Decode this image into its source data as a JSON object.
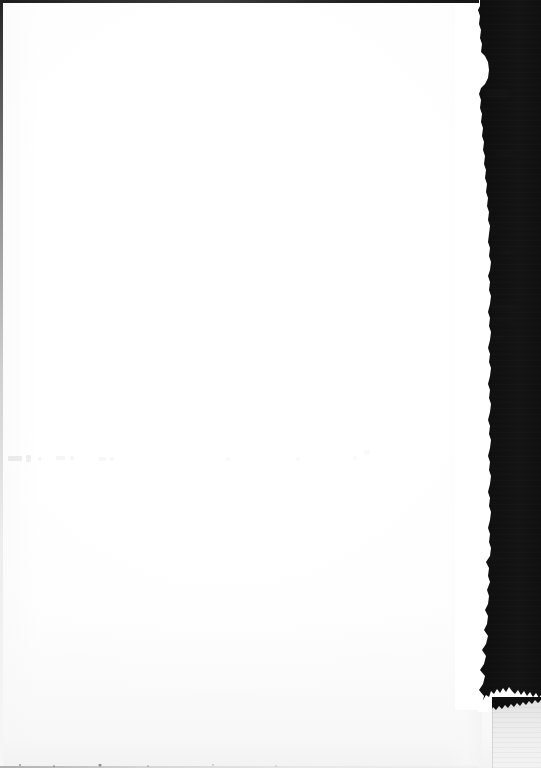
{
  "document": {
    "kind": "scanned-page",
    "title": "Scanned book page (blank verso)",
    "page_content_text": "",
    "visible_text": [],
    "notes_on_content": "No legible printed text is rendered in the pixels; the page body is blank."
  },
  "canvas": {
    "width_px": 541,
    "height_px": 768
  },
  "regions": [
    {
      "name": "paper-sheet",
      "label": "Blank white page",
      "color": "#ffffff",
      "bounds": {
        "x": 0,
        "y": 0,
        "w": 482,
        "h": 768
      }
    },
    {
      "name": "dark-band",
      "label": "Dark scanner background strip",
      "color": "#111111",
      "bounds": {
        "x": 478,
        "y": 0,
        "w": 63,
        "h": 703
      }
    },
    {
      "name": "grey-block",
      "label": "Light grey block at lower right",
      "color": "#ececec",
      "bounds": {
        "x": 492,
        "y": 697,
        "w": 49,
        "h": 71
      }
    },
    {
      "name": "top-edge-line",
      "label": "Dark page edge line along top",
      "color": "#2b2b2b",
      "bounds": {
        "x": 0,
        "y": 0,
        "w": 479,
        "h": 3
      }
    },
    {
      "name": "left-edge-line",
      "label": "Dark page edge line along left, fading downward",
      "color": "#3a3a3a",
      "bounds": {
        "x": 0,
        "y": 0,
        "w": 3,
        "h": 768
      }
    },
    {
      "name": "bottom-edge-line",
      "label": "Faint page edge line along bottom",
      "color": "#bdbdbd",
      "bounds": {
        "x": 0,
        "y": 765,
        "w": 479,
        "h": 3
      }
    },
    {
      "name": "ghost-text-band",
      "label": "Very faint row of show-through marks near mid page",
      "color": "#c9c9cf",
      "bounds": {
        "x": 4,
        "y": 452,
        "w": 420,
        "h": 18
      }
    }
  ],
  "colors": {
    "paper": "#ffffff",
    "dark_background": "#111111",
    "grey_block": "#ececec",
    "edge_line": "#2b2b2b",
    "ghost_mark": "#c9c9cf"
  }
}
